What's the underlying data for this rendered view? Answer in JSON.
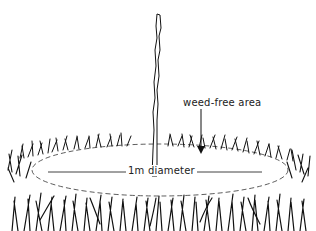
{
  "diagram": {
    "labels": {
      "weed_free": "weed-free area",
      "diameter": "1m diameter"
    },
    "elements": [
      {
        "name": "sapling-stem",
        "description": "thin upright tree whip"
      },
      {
        "name": "weed-free-ring",
        "description": "cleared elliptical area around base (dashed edge)"
      },
      {
        "name": "grass-tufts",
        "description": "surrounding grass"
      },
      {
        "name": "weed-free-arrow",
        "description": "arrow pointing down to cleared area"
      },
      {
        "name": "diameter-line",
        "description": "horizontal dimension line across ring"
      }
    ],
    "colors": {
      "ink": "#111111",
      "background": "#ffffff"
    }
  }
}
